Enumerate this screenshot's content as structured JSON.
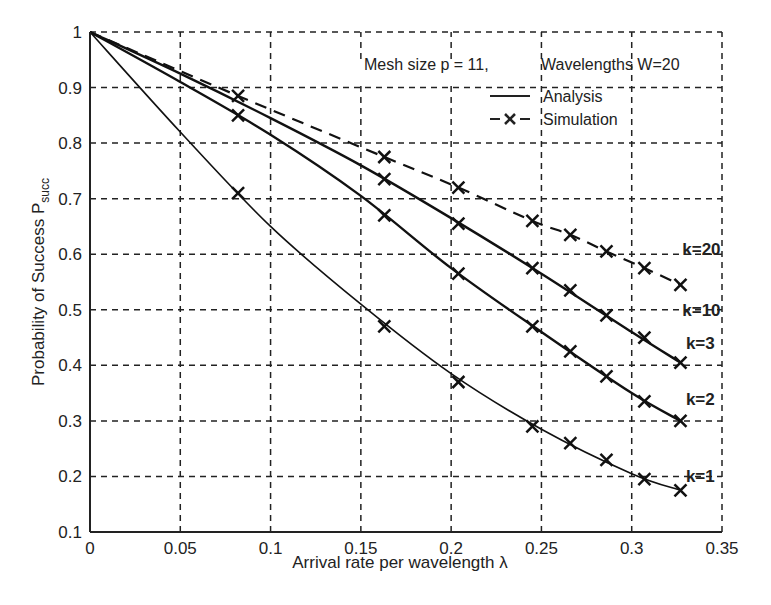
{
  "chart_data": {
    "type": "line",
    "title": "",
    "xlabel": "Arrival rate per wavelength λ",
    "ylabel": "Probability of Success P",
    "ylabel_subscript": "succ",
    "xlim": [
      0,
      0.35
    ],
    "ylim": [
      0.1,
      1
    ],
    "xticks": [
      "0",
      "0.05",
      "0.1",
      "0.15",
      "0.2",
      "0.25",
      "0.3",
      "0.35"
    ],
    "yticks": [
      "0.1",
      "0.2",
      "0.3",
      "0.4",
      "0.5",
      "0.6",
      "0.7",
      "0.8",
      "0.9",
      "1"
    ],
    "grid": true,
    "annotation": {
      "mesh": "Mesh size p = 11,",
      "wavelengths": "Wavelengths W=20"
    },
    "legend": {
      "position": "upper-right",
      "entries": [
        {
          "label": "Analysis",
          "style": "solid"
        },
        {
          "label": "Simulation",
          "style": "dashed-x"
        }
      ]
    },
    "series": [
      {
        "name": "k=1",
        "type": "analysis",
        "style": "solid",
        "x": [
          0,
          0.05,
          0.1,
          0.15,
          0.2,
          0.25,
          0.3,
          0.327
        ],
        "y": [
          1.0,
          0.82,
          0.65,
          0.51,
          0.385,
          0.285,
          0.205,
          0.175
        ]
      },
      {
        "name": "k=1",
        "type": "simulation",
        "style": "x-markers",
        "x": [
          0.082,
          0.163,
          0.204,
          0.245,
          0.266,
          0.286,
          0.307,
          0.327
        ],
        "y": [
          0.71,
          0.47,
          0.37,
          0.29,
          0.26,
          0.23,
          0.195,
          0.175
        ]
      },
      {
        "name": "k=2",
        "type": "analysis",
        "style": "solid",
        "x": [
          0,
          0.05,
          0.1,
          0.15,
          0.2,
          0.25,
          0.3,
          0.327
        ],
        "y": [
          1.0,
          0.91,
          0.815,
          0.705,
          0.575,
          0.46,
          0.35,
          0.3
        ]
      },
      {
        "name": "k=2",
        "type": "simulation",
        "style": "x-markers",
        "x": [
          0.082,
          0.163,
          0.204,
          0.245,
          0.266,
          0.286,
          0.307,
          0.327
        ],
        "y": [
          0.85,
          0.67,
          0.565,
          0.47,
          0.425,
          0.38,
          0.335,
          0.3
        ]
      },
      {
        "name": "k=3",
        "type": "analysis",
        "style": "solid",
        "x": [
          0,
          0.05,
          0.1,
          0.15,
          0.2,
          0.25,
          0.3,
          0.327
        ],
        "y": [
          1.0,
          0.925,
          0.845,
          0.76,
          0.665,
          0.565,
          0.46,
          0.405
        ]
      },
      {
        "name": "k=3",
        "type": "simulation",
        "style": "x-markers",
        "x": [
          0.163,
          0.204,
          0.245,
          0.266,
          0.286,
          0.307,
          0.327
        ],
        "y": [
          0.735,
          0.655,
          0.575,
          0.535,
          0.49,
          0.45,
          0.405
        ]
      },
      {
        "name": "k=20",
        "type": "simulation",
        "style": "dashed-x",
        "x": [
          0,
          0.082,
          0.163,
          0.204,
          0.245,
          0.266,
          0.286,
          0.307,
          0.327
        ],
        "y": [
          1.0,
          0.885,
          0.775,
          0.72,
          0.66,
          0.635,
          0.605,
          0.575,
          0.545
        ]
      }
    ],
    "curve_labels": [
      {
        "text": "k=20",
        "x": 0.328,
        "y": 0.61
      },
      {
        "text": "k=10",
        "x": 0.328,
        "y": 0.5
      },
      {
        "text": "k=3",
        "x": 0.33,
        "y": 0.44
      },
      {
        "text": "k=2",
        "x": 0.33,
        "y": 0.34
      },
      {
        "text": "k=1",
        "x": 0.33,
        "y": 0.2
      }
    ]
  }
}
